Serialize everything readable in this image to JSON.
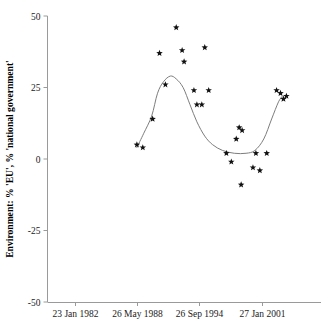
{
  "chart_data": {
    "type": "scatter",
    "title": "",
    "subtitle": "",
    "xlabel": "",
    "ylabel": "Environment: % 'EU', % 'national government'",
    "ylim": [
      -50,
      50
    ],
    "y_ticks": [
      50,
      25,
      0,
      -25,
      -50
    ],
    "y_tick_labels": [
      "50",
      "25",
      "0",
      "-25",
      "-50"
    ],
    "x_tick_labels": [
      "23 Jan 1982",
      "26 May 1988",
      "26 Sep 1994",
      "27 Jan 2001"
    ],
    "x_tick_dates": [
      "1982-01-23",
      "1988-05-26",
      "1994-09-26",
      "2001-01-27"
    ],
    "grid": false,
    "legend": false,
    "legend_position": "none",
    "marker_style": "star",
    "marker_color": "#111111",
    "fit_line_color": "#7d7d7d",
    "axis_color": "#9a9a9a",
    "series": [
      {
        "name": "Environment salience",
        "marker": "star",
        "points": [
          {
            "x": 1988.3,
            "y": 5
          },
          {
            "x": 1988.9,
            "y": 4
          },
          {
            "x": 1989.9,
            "y": 14
          },
          {
            "x": 1990.6,
            "y": 37
          },
          {
            "x": 1991.2,
            "y": 26
          },
          {
            "x": 1992.3,
            "y": 46
          },
          {
            "x": 1992.9,
            "y": 38
          },
          {
            "x": 1993.1,
            "y": 34
          },
          {
            "x": 1994.1,
            "y": 24
          },
          {
            "x": 1994.4,
            "y": 19
          },
          {
            "x": 1994.9,
            "y": 19
          },
          {
            "x": 1995.2,
            "y": 39
          },
          {
            "x": 1995.6,
            "y": 24
          },
          {
            "x": 1997.4,
            "y": 2
          },
          {
            "x": 1997.9,
            "y": -1
          },
          {
            "x": 1998.4,
            "y": 7
          },
          {
            "x": 1998.7,
            "y": 11
          },
          {
            "x": 1999.0,
            "y": 10
          },
          {
            "x": 1998.9,
            "y": -9
          },
          {
            "x": 2000.1,
            "y": -3
          },
          {
            "x": 2000.4,
            "y": 2
          },
          {
            "x": 2000.8,
            "y": -4
          },
          {
            "x": 2001.5,
            "y": 2
          },
          {
            "x": 2002.5,
            "y": 24
          },
          {
            "x": 2002.9,
            "y": 23
          },
          {
            "x": 2003.2,
            "y": 21
          },
          {
            "x": 2003.5,
            "y": 22
          }
        ]
      }
    ],
    "fit_line": {
      "name": "smoothed trend",
      "points": [
        {
          "x": 1988.3,
          "y": 4
        },
        {
          "x": 1989.0,
          "y": 9
        },
        {
          "x": 1989.8,
          "y": 15
        },
        {
          "x": 1990.4,
          "y": 23
        },
        {
          "x": 1991.0,
          "y": 27
        },
        {
          "x": 1991.7,
          "y": 29
        },
        {
          "x": 1992.3,
          "y": 28
        },
        {
          "x": 1993.0,
          "y": 25
        },
        {
          "x": 1993.7,
          "y": 19
        },
        {
          "x": 1994.4,
          "y": 13
        },
        {
          "x": 1995.2,
          "y": 8
        },
        {
          "x": 1996.0,
          "y": 5
        },
        {
          "x": 1997.0,
          "y": 3
        },
        {
          "x": 1998.2,
          "y": 2
        },
        {
          "x": 1999.4,
          "y": 2
        },
        {
          "x": 2000.3,
          "y": 3
        },
        {
          "x": 2001.2,
          "y": 7
        },
        {
          "x": 2002.0,
          "y": 14
        },
        {
          "x": 2002.7,
          "y": 20
        },
        {
          "x": 2003.1,
          "y": 22
        }
      ]
    }
  }
}
